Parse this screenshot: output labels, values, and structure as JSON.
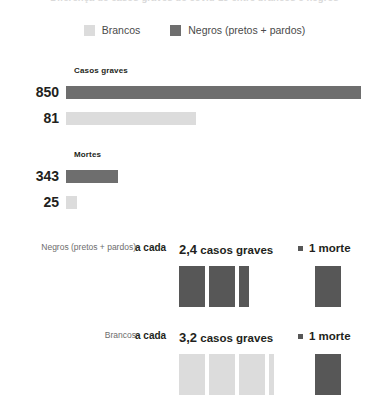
{
  "title": "Diferença de casos graves de covid-19 entre brancos e negros",
  "colors": {
    "brancos": "#dcdcdc",
    "negros": "#6e6e6e",
    "negros_block": "#575757",
    "text": "#231f20",
    "muted": "#6d6d6d"
  },
  "legend": {
    "items": [
      {
        "label": "Brancos",
        "color_key": "brancos",
        "icon": "square-swatch-icon"
      },
      {
        "label": "Negros (pretos + pardos)",
        "color_key": "negros",
        "icon": "square-swatch-icon"
      }
    ]
  },
  "sections": [
    {
      "title": "Casos graves",
      "rows": [
        {
          "value": "850",
          "group": "Negros (pretos + pardos)",
          "color_key": "negros",
          "bar_px": 295
        },
        {
          "value": "81",
          "group": "Brancos",
          "color_key": "brancos",
          "bar_px": 130
        }
      ]
    },
    {
      "title": "Mortes",
      "rows": [
        {
          "value": "343",
          "group": "Negros (pretos + pardos)",
          "color_key": "negros",
          "bar_px": 52
        },
        {
          "value": "25",
          "group": "Brancos",
          "color_key": "brancos",
          "bar_px": 11
        }
      ]
    }
  ],
  "ratios": [
    {
      "who": "Negros (pretos + pardos)",
      "a_cada": "a cada",
      "cases_number": "2,4",
      "cases_label": "casos graves",
      "equals_icon": "equals-square-icon",
      "deaths_text": "1 morte",
      "cases_blocks": [
        1,
        1,
        0.4
      ],
      "death_blocks": [
        1
      ],
      "color_key": "negros_block"
    },
    {
      "who": "Brancos",
      "a_cada": "a cada",
      "cases_number": "3,2",
      "cases_label": "casos graves",
      "equals_icon": "equals-square-icon",
      "deaths_text": "1 morte",
      "cases_blocks": [
        1,
        1,
        1,
        0.2
      ],
      "death_blocks": [
        1
      ],
      "color_key": "brancos"
    }
  ],
  "chart_data": {
    "type": "bar",
    "title": "Diferença de casos graves de covid-19 entre brancos e negros",
    "xlabel": "",
    "ylabel": "",
    "grid": false,
    "legend_position": "top-center",
    "orientation": "horizontal",
    "categories": [
      "Casos graves",
      "Mortes"
    ],
    "series": [
      {
        "name": "Negros (pretos + pardos)",
        "color": "#6e6e6e",
        "values": [
          850,
          343
        ]
      },
      {
        "name": "Brancos",
        "color": "#dcdcdc",
        "values": [
          81,
          25
        ]
      }
    ],
    "annotations": [
      {
        "group": "Negros (pretos + pardos)",
        "text": "a cada 2,4 casos graves = 1 morte",
        "cases_per_death": 2.4,
        "deaths": 1
      },
      {
        "group": "Brancos",
        "text": "a cada 3,2 casos graves = 1 morte",
        "cases_per_death": 3.2,
        "deaths": 1
      }
    ]
  }
}
